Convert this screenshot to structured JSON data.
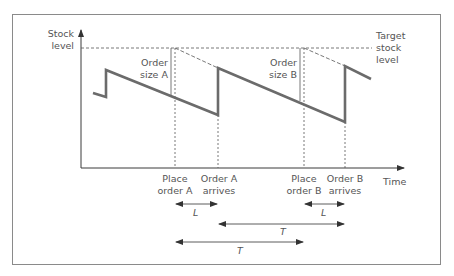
{
  "diagram": {
    "y_axis_label": [
      "Stock",
      "level"
    ],
    "x_axis_label": "Time",
    "target_label": [
      "Target",
      "stock",
      "level"
    ],
    "order_size_a": [
      "Order",
      "size A"
    ],
    "order_size_b": [
      "Order",
      "size B"
    ],
    "events": [
      {
        "label": [
          "Place",
          "order A"
        ]
      },
      {
        "label": [
          "Order A",
          "arrives"
        ]
      },
      {
        "label": [
          "Place",
          "order B"
        ]
      },
      {
        "label": [
          "Order B",
          "arrives"
        ]
      }
    ],
    "intervals": [
      {
        "label": "L",
        "from": "Place order A",
        "to": "Order A arrives"
      },
      {
        "label": "L",
        "from": "Place order B",
        "to": "Order B arrives"
      },
      {
        "label": "T",
        "from": "Order A arrives",
        "to": "Order B arrives"
      },
      {
        "label": "T",
        "from": "Place order A",
        "to": "Place order B"
      }
    ],
    "colors": {
      "stock_line": "#6b6b6b",
      "axis": "#3a3a3a",
      "dashed": "#555555",
      "frame": "#8a8a8a",
      "text": "#555555"
    }
  }
}
